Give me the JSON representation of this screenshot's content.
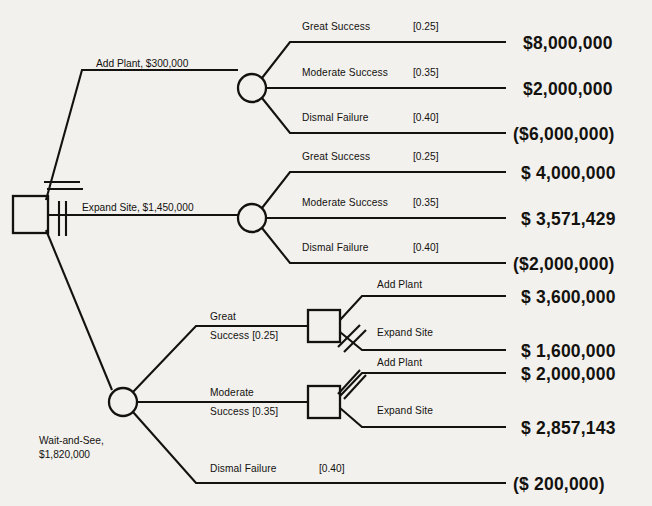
{
  "diagram": {
    "type": "decision-tree",
    "background_color": "#f2f1ee",
    "line_color": "#14120f",
    "root_decision_node": "root-decision-square",
    "alternatives": [
      "Add Plant, $300,000",
      "Expand Site, $1,450,000",
      "Wait-and-See, $1,820,000"
    ],
    "pruned_alternatives": [
      "Add Plant, $300,000",
      "Expand Site, $1,450,000"
    ],
    "chosen_alternative": "Wait-and-See, $1,820,000"
  },
  "root": {
    "branch_add_plant": "Add Plant, $300,000",
    "branch_expand_site": "Expand Site, $1,450,000",
    "branch_wait_line1": "Wait-and-See,",
    "branch_wait_line2": "$1,820,000"
  },
  "add_plant_outcomes": [
    {
      "label": "Great Success",
      "prob": "[0.25]",
      "payoff": "$8,000,000"
    },
    {
      "label": "Moderate Success",
      "prob": "[0.35]",
      "payoff": "$2,000,000"
    },
    {
      "label": "Dismal Failure",
      "prob": "[0.40]",
      "payoff": "($6,000,000)"
    }
  ],
  "expand_site_outcomes": [
    {
      "label": "Great Success",
      "prob": "[0.25]",
      "payoff": "$ 4,000,000"
    },
    {
      "label": "Moderate Success",
      "prob": "[0.35]",
      "payoff": "$ 3,571,429"
    },
    {
      "label": "Dismal Failure",
      "prob": "[0.40]",
      "payoff": "($2,000,000)"
    }
  ],
  "wait_and_see": {
    "great_success": {
      "label_line1": "Great",
      "label_line2": "Success [0.25]",
      "prob": "[0.25]",
      "decisions": [
        {
          "label": "Add Plant",
          "payoff": "$ 3,600,000",
          "pruned": false
        },
        {
          "label": "Expand Site",
          "payoff": "$ 1,600,000",
          "pruned": true
        }
      ]
    },
    "moderate_success": {
      "label_line1": "Moderate",
      "label_line2": "Success [0.35]",
      "prob": "[0.35]",
      "decisions": [
        {
          "label": "Add Plant",
          "payoff": "$ 2,000,000",
          "pruned": true
        },
        {
          "label": "Expand Site",
          "payoff": "$ 2,857,143",
          "pruned": false
        }
      ]
    },
    "dismal_failure": {
      "label": "Dismal Failure",
      "prob": "[0.40]",
      "payoff": "($ 200,000)"
    }
  }
}
